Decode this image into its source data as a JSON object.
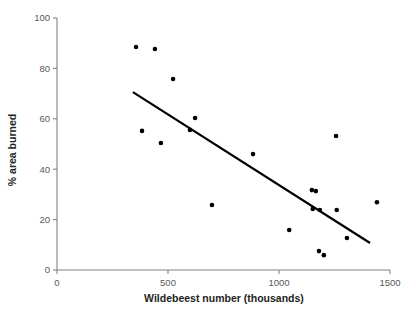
{
  "chart_data": {
    "type": "scatter",
    "title": "",
    "xlabel": "Wildebeest number (thousands)",
    "ylabel": "% area burned",
    "xlim": [
      0,
      1500
    ],
    "ylim": [
      0,
      100
    ],
    "xticks": [
      0,
      500,
      1000,
      1500
    ],
    "xtick_labels": [
      "0",
      "500",
      "1000",
      "1500"
    ],
    "yticks": [
      0,
      20,
      40,
      60,
      80,
      100
    ],
    "ytick_labels": [
      "0",
      "20",
      "40",
      "60",
      "80",
      "100"
    ],
    "grid": false,
    "legend": false,
    "marker_color": "#000000",
    "marker_size": 4.6,
    "axis_color": "#808285",
    "points": [
      {
        "x": 356,
        "y": 88.5
      },
      {
        "x": 441,
        "y": 87.7
      },
      {
        "x": 523,
        "y": 75.8
      },
      {
        "x": 383,
        "y": 55.2
      },
      {
        "x": 468,
        "y": 50.4
      },
      {
        "x": 599,
        "y": 55.6
      },
      {
        "x": 622,
        "y": 60.3
      },
      {
        "x": 698,
        "y": 25.8
      },
      {
        "x": 883,
        "y": 46.0
      },
      {
        "x": 1046,
        "y": 15.9
      },
      {
        "x": 1148,
        "y": 31.7
      },
      {
        "x": 1166,
        "y": 31.3
      },
      {
        "x": 1152,
        "y": 24.2
      },
      {
        "x": 1184,
        "y": 23.8
      },
      {
        "x": 1180,
        "y": 7.5
      },
      {
        "x": 1202,
        "y": 5.9
      },
      {
        "x": 1257,
        "y": 53.2
      },
      {
        "x": 1260,
        "y": 23.8
      },
      {
        "x": 1306,
        "y": 12.7
      },
      {
        "x": 1441,
        "y": 26.9
      }
    ],
    "trend_line": {
      "x_start": 342,
      "y_start": 70.6,
      "x_end": 1410,
      "y_end": 10.7,
      "color": "#000000",
      "width": 2.2
    }
  },
  "figure": {
    "background": "#ffffff"
  }
}
